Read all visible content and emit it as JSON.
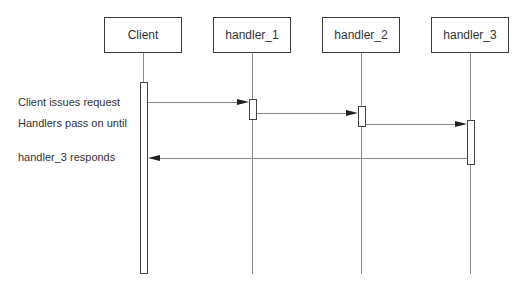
{
  "diagram": {
    "type": "sequence",
    "participants": [
      {
        "label": "Client"
      },
      {
        "label": "handler_1"
      },
      {
        "label": "handler_2"
      },
      {
        "label": "handler_3"
      }
    ],
    "messages": [
      {
        "from": "Client",
        "to": "handler_1",
        "kind": "call"
      },
      {
        "from": "handler_1",
        "to": "handler_2",
        "kind": "call"
      },
      {
        "from": "handler_2",
        "to": "handler_3",
        "kind": "call"
      },
      {
        "from": "handler_3",
        "to": "Client",
        "kind": "return"
      }
    ],
    "notes": [
      {
        "text": "Client issues request"
      },
      {
        "text": "Handlers pass on until"
      },
      {
        "text": "handler_3 responds"
      }
    ],
    "colors": {
      "box_border": "#3a3a3a",
      "lifeline": "#8a8a8a",
      "arrowhead": "#222222",
      "text": "#333333"
    }
  }
}
